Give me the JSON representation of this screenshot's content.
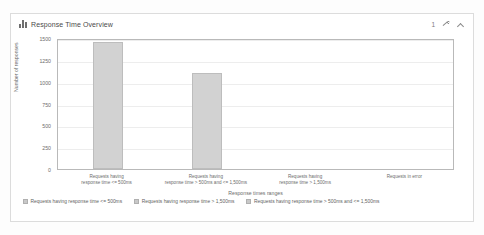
{
  "panel": {
    "title": "Response Time Overview",
    "icon": "bar-chart-icon",
    "tools": {
      "count": "1",
      "settings_icon": "wrench-icon",
      "collapse_icon": "chevron-up-icon"
    }
  },
  "chart_data": {
    "type": "bar",
    "title": "Response Time Overview",
    "xlabel": "Response times ranges",
    "ylabel": "Number of responses",
    "ylim": [
      0,
      1500
    ],
    "yticks": [
      1500,
      1250,
      1000,
      750,
      500,
      250,
      0
    ],
    "grid": true,
    "legend_position": "bottom-left",
    "categories": [
      "Requests having response time <= 500ms",
      "Requests having response time > 500ms and <= 1,500ms",
      "Requests having response time > 1,500ms",
      "Requests in error"
    ],
    "category_lines": [
      [
        "Requests having",
        "response time <= 500ms"
      ],
      [
        "Requests having",
        "response time > 500ms and <= 1,500ms"
      ],
      [
        "Requests having",
        "response time > 1,500ms"
      ],
      [
        "Requests in error",
        ""
      ]
    ],
    "values": [
      1450,
      1100,
      0,
      0
    ],
    "bar_color": "#d2d2d2"
  },
  "legend": [
    {
      "label": "Requests having response time <= 500ms",
      "color": "#c8c8c8"
    },
    {
      "label": "Requests having response time > 1,500ms",
      "color": "#c8c8c8"
    },
    {
      "label": "Requests having response time > 500ms and <= 1,500ms",
      "color": "#c8c8c8"
    }
  ]
}
